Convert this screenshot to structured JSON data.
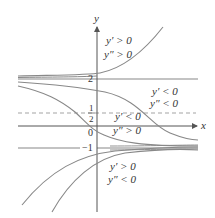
{
  "axes": {
    "x_label": "x",
    "y_label": "y",
    "origin_label": "0"
  },
  "ticks": {
    "two": "2",
    "neg_one": "−1",
    "half_num": "1",
    "half_den": "2"
  },
  "regions": {
    "top": {
      "line1": "y′ > 0",
      "line2": "y″ > 0"
    },
    "right_mid": {
      "line1": "y′ < 0",
      "line2": "y″ < 0"
    },
    "center": {
      "line1": "y′ < 0",
      "line2": "y″ > 0"
    },
    "bottom": {
      "line1": "y′ > 0",
      "line2": "y″ < 0"
    }
  },
  "colors": {
    "curve": "#888888",
    "axis": "#555555",
    "text": "#333333",
    "dashed": "#999999"
  },
  "equilibria": {
    "y_two": 2,
    "y_neg_one": -1,
    "inflection_half": 0.5
  }
}
